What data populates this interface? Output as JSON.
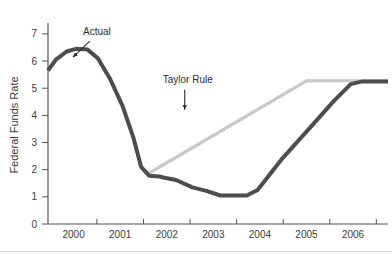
{
  "chart_data": {
    "type": "line",
    "title": "",
    "xlabel": "",
    "ylabel": "Federal Funds Rate",
    "ylim": [
      0,
      7.4
    ],
    "xlim": [
      1999.45,
      2006.75
    ],
    "yticks": [
      "0",
      "1",
      "2",
      "3",
      "4",
      "5",
      "6",
      "7"
    ],
    "ytick_values": [
      0,
      1,
      2,
      3,
      4,
      5,
      6,
      7
    ],
    "xticks": [
      "2000",
      "2001",
      "2002",
      "2003",
      "2004",
      "2005",
      "2006"
    ],
    "xtick_values": [
      2000,
      2001,
      2002,
      2003,
      2004,
      2005,
      2006
    ],
    "grid": false,
    "legend": "none",
    "annotations": [
      {
        "text": "Actual",
        "x": 2000.5,
        "y": 6.95,
        "arrow": "down-left"
      },
      {
        "text": "Taylor Rule",
        "x": 2002.45,
        "y": 5.2,
        "arrow": "down"
      }
    ],
    "series": [
      {
        "name": "Actual",
        "color": "#4d4d4d",
        "x": [
          1999.45,
          1999.62,
          1999.85,
          2000.05,
          2000.3,
          2000.52,
          2000.78,
          2001.05,
          2001.28,
          2001.45,
          2001.62,
          2001.85,
          2001.95,
          2002.2,
          2002.55,
          2002.85,
          2003.15,
          2003.72,
          2003.95,
          2004.45,
          2005.0,
          2005.6,
          2005.95,
          2006.2,
          2006.75
        ],
        "y": [
          5.65,
          6.05,
          6.35,
          6.45,
          6.42,
          6.1,
          5.35,
          4.35,
          3.2,
          2.1,
          1.78,
          1.75,
          1.7,
          1.62,
          1.35,
          1.22,
          1.05,
          1.05,
          1.25,
          2.35,
          3.4,
          4.55,
          5.15,
          5.25,
          5.25
        ]
      },
      {
        "name": "Taylor Rule",
        "color": "#c9c9c9",
        "x": [
          2001.57,
          2005.0,
          2006.75
        ],
        "y": [
          1.82,
          5.27,
          5.27
        ]
      }
    ]
  },
  "axis": {
    "y_axis_name": "y-axis",
    "x_axis_name": "x-axis"
  }
}
